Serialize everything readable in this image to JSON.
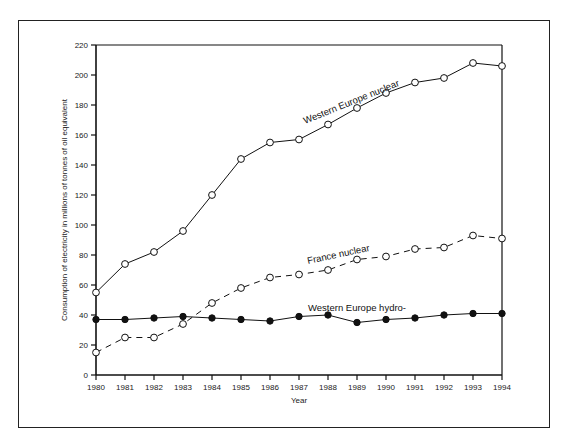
{
  "chart_data": {
    "type": "line",
    "title": "",
    "xlabel": "Year",
    "ylabel": "Consumption of electricity in millions of tonnes of oil equivalent",
    "x": [
      1980,
      1981,
      1982,
      1983,
      1984,
      1985,
      1986,
      1987,
      1988,
      1989,
      1990,
      1991,
      1992,
      1993,
      1994
    ],
    "ylim": [
      0,
      220
    ],
    "yticks": [
      0,
      20,
      40,
      60,
      80,
      100,
      120,
      140,
      160,
      180,
      200,
      220
    ],
    "grid": false,
    "legend": "inline labels",
    "series": [
      {
        "name": "Western Europe nuclear",
        "marker": "open-circle",
        "line": "solid",
        "values": [
          55,
          74,
          82,
          96,
          120,
          144,
          155,
          157,
          167,
          178,
          188,
          195,
          198,
          208,
          206
        ]
      },
      {
        "name": "France nuclear",
        "marker": "open-circle",
        "line": "dashed",
        "values": [
          15,
          25,
          25,
          34,
          48,
          58,
          65,
          67,
          70,
          77,
          79,
          84,
          85,
          93,
          91
        ]
      },
      {
        "name": "Western Europe hydro-",
        "marker": "filled-circle",
        "line": "solid",
        "values": [
          37,
          37,
          38,
          39,
          38,
          37,
          36,
          39,
          40,
          35,
          37,
          38,
          40,
          41,
          41
        ]
      }
    ]
  }
}
